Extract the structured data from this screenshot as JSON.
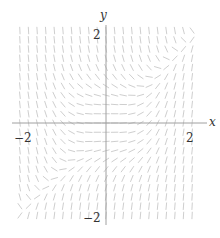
{
  "diagram": {
    "type": "slope_field",
    "axes": {
      "x_label": "x",
      "y_label": "y",
      "x_ticks": [
        {
          "value": -2,
          "label": "−2"
        },
        {
          "value": 2,
          "label": "2"
        }
      ],
      "y_ticks": [
        {
          "value": 2,
          "label": "2"
        },
        {
          "value": -2,
          "label": "−2"
        }
      ],
      "x_range": [
        -2.05,
        2.05
      ],
      "y_range": [
        -2.15,
        2.15
      ]
    },
    "field": {
      "description": "Slope field, slopes near zero along y = x, steep negative in upper-left, steep positive in lower-right",
      "grid_x_count": 21,
      "grid_y_count": 21,
      "segment_color": "#c8c8c8",
      "axis_color": "#a0a0a0"
    },
    "labels": {
      "x_axis": "x",
      "y_axis": "y",
      "x_tick_neg": "−2",
      "x_tick_pos": "2",
      "y_tick_pos": "2",
      "y_tick_neg": "−2"
    }
  }
}
